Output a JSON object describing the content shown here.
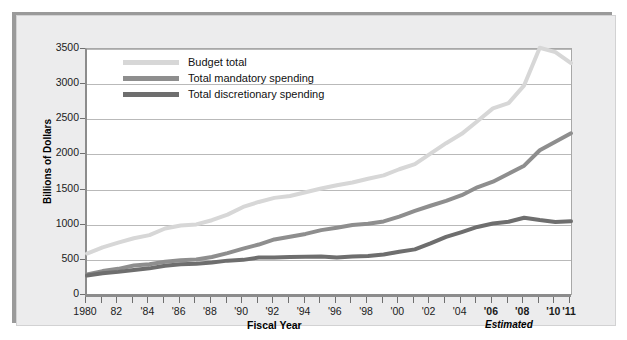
{
  "chart_data": {
    "type": "line",
    "title": "",
    "xlabel": "Fiscal Year",
    "ylabel": "Billions of Dollars",
    "ylim": [
      0,
      3500
    ],
    "yticks": [
      0,
      500,
      1000,
      1500,
      2000,
      2500,
      3000,
      3500
    ],
    "ytick_labels": [
      "0",
      "500",
      "1000",
      "1500",
      "2000",
      "2500",
      "3000",
      "3500"
    ],
    "grid": true,
    "legend_position": "top-left inside",
    "x": [
      1980,
      1981,
      1982,
      1983,
      1984,
      1985,
      1986,
      1987,
      1988,
      1989,
      1990,
      1991,
      1992,
      1993,
      1994,
      1995,
      1996,
      1997,
      1998,
      1999,
      2000,
      2001,
      2002,
      2003,
      2004,
      2005,
      2006,
      2007,
      2008,
      2009,
      2010,
      2011
    ],
    "xtick_labels": [
      "1980",
      "82",
      "'84",
      "'86",
      "'88",
      "'90",
      "'92",
      "'94",
      "'96",
      "'98",
      "'00",
      "'02",
      "'04",
      "'06",
      "'08",
      "'10",
      "'11"
    ],
    "xtick_years": [
      1980,
      1982,
      1984,
      1986,
      1988,
      1990,
      1992,
      1994,
      1996,
      1998,
      2000,
      2002,
      2004,
      2006,
      2008,
      2010,
      2011
    ],
    "xtick_bold": [
      false,
      false,
      false,
      false,
      false,
      false,
      false,
      false,
      false,
      false,
      false,
      false,
      false,
      true,
      true,
      true,
      true
    ],
    "annotation": "Estimated",
    "series": [
      {
        "name": "Budget total",
        "color": "#d7d7d7",
        "values": [
          590,
          678,
          746,
          808,
          852,
          946,
          990,
          1004,
          1064,
          1143,
          1253,
          1324,
          1382,
          1409,
          1462,
          1516,
          1561,
          1601,
          1653,
          1702,
          1789,
          1863,
          2011,
          2160,
          2293,
          2472,
          2655,
          2729,
          2983,
          3518,
          3456,
          3300
        ],
        "style": "solid",
        "linewidth": 4
      },
      {
        "name": "Total mandatory spending",
        "color": "#8e8e8e",
        "values": [
          291,
          340,
          372,
          420,
          437,
          474,
          495,
          505,
          540,
          595,
          660,
          718,
          790,
          829,
          869,
          923,
          958,
          997,
          1013,
          1047,
          1116,
          1197,
          1270,
          1338,
          1420,
          1532,
          1612,
          1726,
          1840,
          2060,
          2180,
          2300
        ],
        "style": "solid",
        "linewidth": 4
      },
      {
        "name": "Total discretionary spending",
        "color": "#6e6e6e",
        "values": [
          276,
          308,
          329,
          355,
          379,
          416,
          438,
          444,
          464,
          489,
          500,
          533,
          534,
          540,
          545,
          546,
          534,
          548,
          555,
          575,
          615,
          649,
          734,
          826,
          895,
          968,
          1017,
          1042,
          1100,
          1067,
          1040,
          1050
        ],
        "style": "solid",
        "linewidth": 4
      }
    ]
  },
  "legend": {
    "items": [
      {
        "label": "Budget total",
        "color": "#d7d7d7"
      },
      {
        "label": "Total mandatory spending",
        "color": "#8e8e8e"
      },
      {
        "label": "Total discretionary spending",
        "color": "#6e6e6e"
      }
    ]
  },
  "axes": {
    "y_title": "Billions of Dollars",
    "x_title": "Fiscal Year",
    "estimated_note": "Estimated"
  }
}
